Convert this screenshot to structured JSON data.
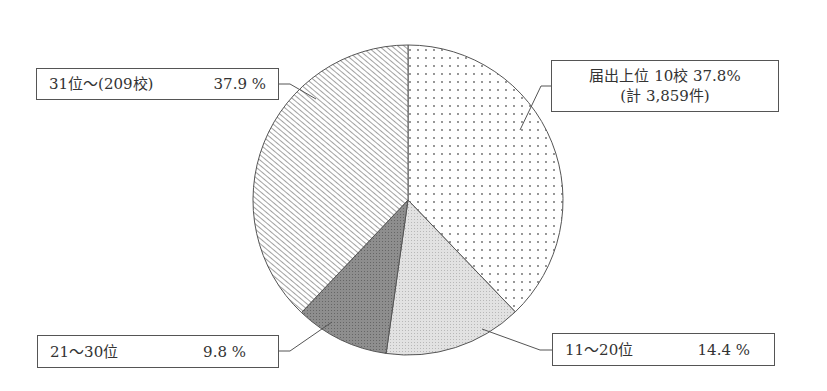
{
  "chart_data": {
    "type": "pie",
    "title": "",
    "start_angle": "12 o'clock",
    "direction": "clockwise",
    "slices": [
      {
        "label": "届出上位 10校",
        "sublabel": "(計 3,859件)",
        "value": 37.8,
        "pattern": "dots",
        "fill": "#ffffff"
      },
      {
        "label": "11〜20位",
        "value": 14.4,
        "pattern": "fine-stipple-light",
        "fill": "#dddddd"
      },
      {
        "label": "21〜30位",
        "value": 9.8,
        "pattern": "fine-stipple-dark",
        "fill": "#8a8a8a"
      },
      {
        "label": "31位〜(209校)",
        "value": 37.9,
        "pattern": "diagonal-hatch",
        "fill": "#ffffff"
      }
    ],
    "unit": "%"
  },
  "labels": {
    "top_right": {
      "line1": "届出上位 10校 37.8%",
      "line2": "(計 3,859件)"
    },
    "bottom_right": {
      "name": "11〜20位",
      "value": "14.4 %"
    },
    "bottom_left": {
      "name": "21〜30位",
      "value": "9.8 %"
    },
    "top_left": {
      "name": "31位〜(209校)",
      "value": "37.9 %"
    }
  },
  "colors": {
    "outline": "#555555",
    "dots": "#666666",
    "light_fill": "#dcdcdc",
    "dark_fill": "#8c8c8c",
    "hatch": "#555555"
  }
}
